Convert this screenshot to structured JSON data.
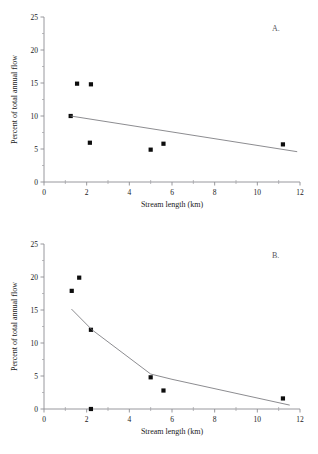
{
  "figure": {
    "panels": [
      "A.",
      "B."
    ]
  },
  "chart_data": [
    {
      "type": "scatter",
      "panel_label": "A.",
      "title": "",
      "xlabel": "Stream length (km)",
      "ylabel": "Percent of total annual flow",
      "xlim": [
        0,
        12
      ],
      "ylim": [
        0,
        25
      ],
      "xticks": [
        0,
        2,
        4,
        6,
        8,
        10,
        12
      ],
      "xtick_labels": [
        "0",
        "2",
        "4",
        "6",
        "8",
        "10",
        "12"
      ],
      "xminor_ticks": [
        1,
        3,
        5,
        7,
        9,
        11
      ],
      "yticks": [
        0,
        5,
        10,
        15,
        20,
        25
      ],
      "ytick_labels": [
        "0",
        "5",
        "10",
        "15",
        "20",
        "25"
      ],
      "yminor_ticks": [
        2.5,
        7.5,
        12.5,
        17.5,
        22.5
      ],
      "grid": false,
      "legend": false,
      "series": [
        {
          "name": "observations",
          "marker": "filled-square",
          "points": [
            {
              "x": 1.25,
              "y": 10.0
            },
            {
              "x": 1.55,
              "y": 14.9
            },
            {
              "x": 2.2,
              "y": 14.8
            },
            {
              "x": 2.15,
              "y": 5.95
            },
            {
              "x": 5.0,
              "y": 4.9
            },
            {
              "x": 5.6,
              "y": 5.8
            },
            {
              "x": 11.2,
              "y": 5.7
            }
          ]
        },
        {
          "name": "regression line",
          "marker": "none",
          "points": [
            {
              "x": 1.25,
              "y": 10.0
            },
            {
              "x": 11.85,
              "y": 4.6
            }
          ]
        }
      ]
    },
    {
      "type": "scatter",
      "panel_label": "B.",
      "title": "",
      "xlabel": "Stream length (km)",
      "ylabel": "Percent of total annual flow",
      "xlim": [
        0,
        12
      ],
      "ylim": [
        0,
        25
      ],
      "xticks": [
        0,
        2,
        4,
        6,
        8,
        10,
        12
      ],
      "xtick_labels": [
        "0",
        "2",
        "4",
        "6",
        "8",
        "10",
        "12"
      ],
      "xminor_ticks": [
        1,
        3,
        5,
        7,
        9,
        11
      ],
      "yticks": [
        0,
        5,
        10,
        15,
        20,
        25
      ],
      "ytick_labels": [
        "0",
        "5",
        "10",
        "15",
        "20",
        "25"
      ],
      "yminor_ticks": [
        2.5,
        7.5,
        12.5,
        17.5,
        22.5
      ],
      "grid": false,
      "legend": false,
      "series": [
        {
          "name": "observations",
          "marker": "filled-square",
          "points": [
            {
              "x": 1.3,
              "y": 17.9
            },
            {
              "x": 1.65,
              "y": 19.9
            },
            {
              "x": 2.2,
              "y": 12.0
            },
            {
              "x": 2.2,
              "y": 0.0
            },
            {
              "x": 5.0,
              "y": 4.8
            },
            {
              "x": 5.6,
              "y": 2.8
            },
            {
              "x": 11.2,
              "y": 1.6
            }
          ]
        },
        {
          "name": "fitted curve",
          "marker": "none",
          "points": [
            {
              "x": 1.3,
              "y": 15.1
            },
            {
              "x": 2.25,
              "y": 12.0
            },
            {
              "x": 5.0,
              "y": 5.3
            },
            {
              "x": 6.0,
              "y": 4.5
            },
            {
              "x": 11.5,
              "y": 0.6
            }
          ]
        }
      ]
    }
  ]
}
